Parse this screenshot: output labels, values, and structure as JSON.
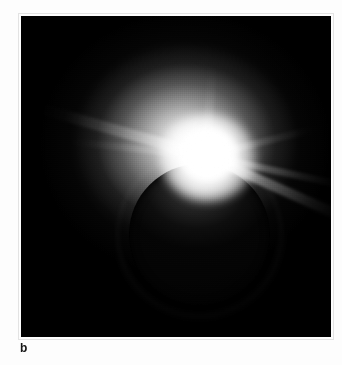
{
  "figure": {
    "panel_label": "b",
    "plate": {
      "background_color": "#000000",
      "left": 21,
      "top": 16,
      "width": 310,
      "height": 321
    },
    "page_background_color": "#fdfdfd",
    "label_color": "#161616",
    "elements": [
      {
        "name": "moon-disc",
        "description": "occulting dark lunar disc",
        "center_x": 178,
        "center_y": 218,
        "radius": 70,
        "color": "#040404"
      },
      {
        "name": "limb-ring",
        "description": "bright chromosphere ring along lunar limb",
        "color": "#ffffff"
      },
      {
        "name": "diamond-ring-flare",
        "description": "brightest point of light at upper limb",
        "center_x": 186,
        "center_y": 141,
        "color": "#ffffff"
      },
      {
        "name": "corona",
        "description": "diffuse white corona halo extending outward",
        "color": "#e6e6e6"
      },
      {
        "name": "diffraction-spikes",
        "description": "linear light streaks radiating from the flare",
        "count": 6,
        "color": "#ffffff"
      }
    ]
  }
}
